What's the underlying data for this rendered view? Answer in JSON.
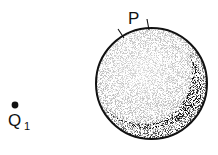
{
  "diagram": {
    "type": "physics-electrostatics",
    "sphere": {
      "center": [
        151.5,
        83.5
      ],
      "radius": 56,
      "fill": "stippled",
      "shading": "darker crescent toward lower-right"
    },
    "patch": {
      "label": "P",
      "tick_marks": [
        [
          118,
          30,
          124,
          38
        ],
        [
          147,
          19,
          149,
          29
        ]
      ]
    },
    "charge": {
      "label": "Q",
      "subscript": "1",
      "position": [
        15,
        105
      ]
    },
    "colors": {
      "ink": "#111111",
      "background": "#ffffff"
    }
  }
}
